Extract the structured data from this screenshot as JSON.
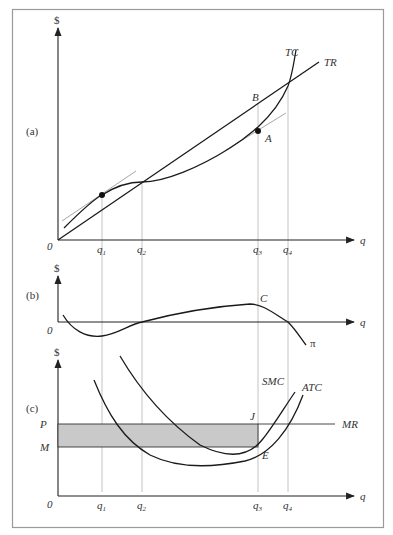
{
  "figure": {
    "panels": [
      {
        "id": "a",
        "label": "(a)",
        "y_axis_label": "$",
        "x_axis_label": "q",
        "origin_label": "0",
        "curves": [
          {
            "name": "TC",
            "label": "TC"
          },
          {
            "name": "TR",
            "label": "TR"
          }
        ],
        "points": [
          {
            "name": "A",
            "label": "A",
            "description": "tangent point on TC at q3"
          },
          {
            "name": "B",
            "label": "B",
            "description": "point on TR at q3"
          },
          {
            "name": "tangent-q1",
            "label": "",
            "description": "tangent point on TC at q1"
          }
        ],
        "x_ticks": [
          "q1",
          "q2",
          "q3",
          "q4"
        ]
      },
      {
        "id": "b",
        "label": "(b)",
        "y_axis_label": "$",
        "x_axis_label": "q",
        "origin_label": "0",
        "curves": [
          {
            "name": "profit",
            "label": "π"
          }
        ],
        "points": [
          {
            "name": "C",
            "label": "C",
            "description": "maximum profit at q3"
          }
        ]
      },
      {
        "id": "c",
        "label": "(c)",
        "y_axis_label": "$",
        "x_axis_label": "q",
        "origin_label": "0",
        "y_ticks": [
          "P",
          "M"
        ],
        "curves": [
          {
            "name": "SMC",
            "label": "SMC"
          },
          {
            "name": "ATC",
            "label": "ATC"
          },
          {
            "name": "MR",
            "label": "MR"
          }
        ],
        "points": [
          {
            "name": "J",
            "label": "J",
            "description": "SMC = MR at q3"
          },
          {
            "name": "E",
            "label": "E",
            "description": "ATC at q3"
          }
        ],
        "shaded_region": "profit rectangle between P and M from 0 to q3",
        "x_ticks": [
          "q1",
          "q2",
          "q3",
          "q4"
        ]
      }
    ],
    "tick_base": "q",
    "tick_subscripts": [
      "1",
      "2",
      "3",
      "4"
    ],
    "colors": {
      "frame": "#9a9a9a",
      "shade": "#c9c9c9",
      "guide": "#b5b5b5",
      "ink": "#1a1a1a"
    }
  }
}
